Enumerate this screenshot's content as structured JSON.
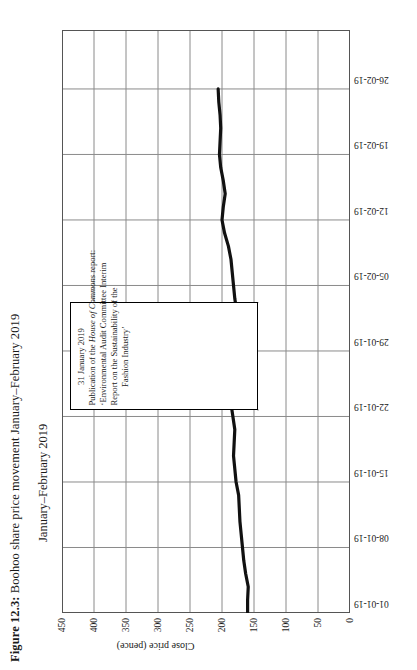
{
  "figure": {
    "label": "Figure 12.3:",
    "title_text": "Boohoo share price movement January–February 2019",
    "full_title": "Figure 12.3: Boohoo share price movement January–February 2019",
    "subtitle": "January–February 2019"
  },
  "annotation": {
    "date": "31 January 2019",
    "line1": "Publication of the ",
    "line1_italic": "House of Commons",
    "line1_tail": " report:",
    "line2": "‘Environmental Audit Committee Interim",
    "line3": "Report on the Sustainability of the",
    "line4": "Fashion Industry’"
  },
  "colors": {
    "series_line": "#111111",
    "grid": "#8a8a8a",
    "axis": "#444444",
    "background": "#ffffff",
    "text": "#1a1a1a"
  },
  "chart_data": {
    "type": "line",
    "title": "Boohoo share price movement January–February 2019",
    "subtitle": "January–February 2019",
    "xlabel": "January–February 2019",
    "ylabel": "Close price (pence)",
    "ylim": [
      0,
      450
    ],
    "ytick_labels": [
      "0",
      "50",
      "100",
      "150",
      "200",
      "250",
      "300",
      "350",
      "400",
      "450"
    ],
    "ytick_values": [
      0,
      50,
      100,
      150,
      200,
      250,
      300,
      350,
      400,
      450
    ],
    "xtick_labels": [
      "01-01-19",
      "08-01-19",
      "15-01-19",
      "22-01-19",
      "29-01-19",
      "05-02-19",
      "12-02-19",
      "19-02-19",
      "26-02-19"
    ],
    "grid": true,
    "legend": false,
    "series": [
      {
        "name": "Boohoo close price (pence)",
        "color": "#111111",
        "x": [
          "01-01-19",
          "02-01-19",
          "03-01-19",
          "04-01-19",
          "07-01-19",
          "08-01-19",
          "09-01-19",
          "10-01-19",
          "11-01-19",
          "14-01-19",
          "15-01-19",
          "16-01-19",
          "17-01-19",
          "18-01-19",
          "21-01-19",
          "22-01-19",
          "23-01-19",
          "24-01-19",
          "25-01-19",
          "28-01-19",
          "29-01-19",
          "30-01-19",
          "31-01-19",
          "01-02-19",
          "04-02-19",
          "05-02-19",
          "06-02-19",
          "07-02-19",
          "08-02-19",
          "11-02-19",
          "12-02-19",
          "13-02-19",
          "14-02-19",
          "15-02-19",
          "18-02-19",
          "19-02-19",
          "20-02-19",
          "21-02-19",
          "22-02-19",
          "25-02-19",
          "26-02-19"
        ],
        "values": [
          160,
          160,
          159,
          163,
          166,
          168,
          170,
          172,
          173,
          174,
          178,
          180,
          182,
          181,
          180,
          183,
          186,
          188,
          186,
          184,
          185,
          188,
          178,
          177,
          180,
          182,
          184,
          186,
          190,
          196,
          200,
          198,
          195,
          198,
          202,
          204,
          203,
          202,
          203,
          205,
          206
        ]
      }
    ],
    "annotations": [
      {
        "target_x": "31-01-19",
        "target_y": 178,
        "text": "31 January 2019 Publication of the House of Commons report: ‘Environmental Audit Committee Interim Report on the Sustainability of the Fashion Industry’"
      }
    ]
  }
}
